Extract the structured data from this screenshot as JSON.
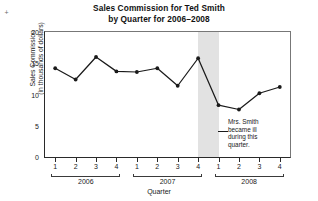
{
  "chart_data": {
    "type": "line",
    "title": "Sales Commission for Ted Smith by Quarter for 2006–2008",
    "title_line1": "Sales Commission for Ted Smith",
    "title_line2": "by Quarter for 2006–2008",
    "xlabel": "Quarter",
    "ylabel": "Sales Commission (in thousands of dollars)",
    "ylabel_line1": "Sales Commission",
    "ylabel_line2": "(in thousands of dollars)",
    "ylim": [
      0,
      20
    ],
    "yticks": [
      0,
      5,
      10,
      15,
      20
    ],
    "ytick_labels": [
      "0",
      "5",
      "10",
      "15",
      "20"
    ],
    "grid": false,
    "legend": false,
    "marker": "filled-circle",
    "line_color": "#1a1a1a",
    "marker_color": "#1a1a1a",
    "categories": [
      "2006 Q1",
      "2006 Q2",
      "2006 Q3",
      "2006 Q4",
      "2007 Q1",
      "2007 Q2",
      "2007 Q3",
      "2007 Q4",
      "2008 Q1",
      "2008 Q2",
      "2008 Q3",
      "2008 Q4"
    ],
    "quarter_labels": [
      "1",
      "2",
      "3",
      "4",
      "1",
      "2",
      "3",
      "4",
      "1",
      "2",
      "3",
      "4"
    ],
    "values": [
      14.2,
      12.4,
      16.0,
      13.7,
      13.6,
      14.2,
      11.4,
      15.8,
      8.3,
      7.6,
      10.2,
      11.2
    ],
    "groups": [
      {
        "label": "2006",
        "start_index": 0,
        "end_index": 3
      },
      {
        "label": "2007",
        "start_index": 4,
        "end_index": 7
      },
      {
        "label": "2008",
        "start_index": 8,
        "end_index": 11
      }
    ],
    "highlight_band": {
      "from_category": "2007 Q4",
      "to_category": "2008 Q1",
      "color": "#e2e2e2"
    },
    "annotations": [
      {
        "text": "Mrs. Smith became ill during this quarter.",
        "line1": "Mrs. Smith",
        "line2": "became ill",
        "line3": "during this",
        "line4": "quarter.",
        "points_to": "2008 Q1"
      }
    ]
  },
  "corner": {
    "mark": "+"
  }
}
